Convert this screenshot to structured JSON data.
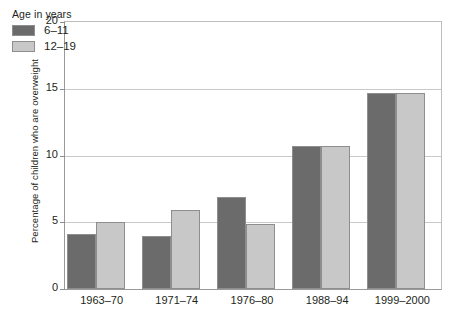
{
  "chart_data": {
    "type": "bar",
    "title": "",
    "subtitle": "",
    "xlabel": "",
    "ylabel": "Percentage of children who are overweight",
    "ylim": [
      0,
      20
    ],
    "yticks": [
      0,
      5,
      10,
      15,
      20
    ],
    "ytick_labels": [
      "0",
      "5",
      "10",
      "15",
      "20"
    ],
    "grid": true,
    "grid_axis": "y",
    "legend_position": "inside top-left",
    "legend_title": "Age in years",
    "categories": [
      "1963–70",
      "1971–74",
      "1976–80",
      "1988–94",
      "1999–2000"
    ],
    "series": [
      {
        "name": "6–11",
        "color": "#6b6b6b",
        "values": [
          4.1,
          4.0,
          6.9,
          10.7,
          14.7
        ]
      },
      {
        "name": "12–19",
        "color": "#c8c8c8",
        "values": [
          5.0,
          5.9,
          4.9,
          10.7,
          14.7
        ]
      }
    ],
    "annotations": []
  },
  "colors": {
    "series_1": "#6b6b6b",
    "series_2": "#c8c8c8",
    "gridline": "#c9c9c9",
    "axis": "#9a9a9a",
    "text": "#231f20",
    "background": "#ffffff"
  }
}
